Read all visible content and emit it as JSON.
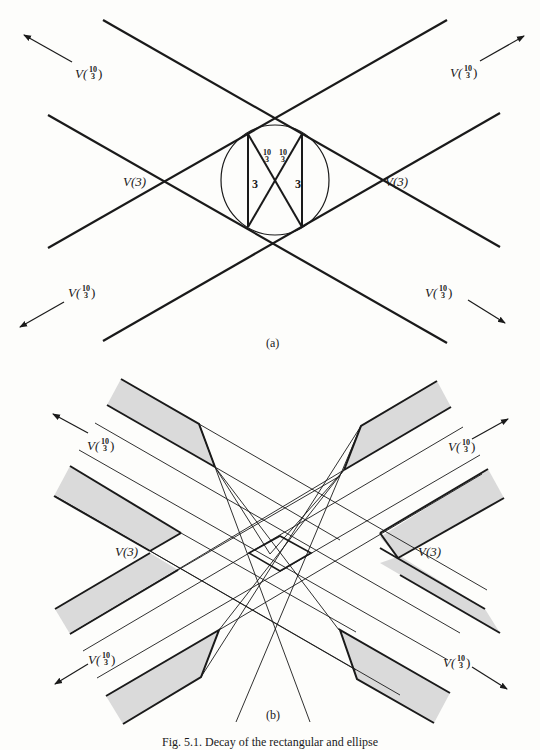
{
  "figure": {
    "caption": "Fig. 5.1. Decay of the rectangular and ellipse",
    "panels": [
      {
        "id": "a",
        "label": "(a)",
        "velocity_labels": {
          "top_left": {
            "prefix": "V(",
            "num": "10",
            "den": "3",
            "suffix": ")"
          },
          "top_right": {
            "prefix": "V(",
            "num": "10",
            "den": "3",
            "suffix": ")"
          },
          "bottom_left": {
            "prefix": "V(",
            "num": "10",
            "den": "3",
            "suffix": ")"
          },
          "bottom_right": {
            "prefix": "V(",
            "num": "10",
            "den": "3",
            "suffix": ")"
          },
          "left": "V(3)",
          "right": "V(3)"
        },
        "inner_labels": {
          "side_left": "3",
          "side_right": "3",
          "diag_left": {
            "num": "10",
            "den": "3"
          },
          "diag_right": {
            "num": "10",
            "den": "3"
          }
        }
      },
      {
        "id": "b",
        "label": "(b)",
        "velocity_labels": {
          "top_left": {
            "prefix": "V(",
            "num": "10",
            "den": "3",
            "suffix": ")"
          },
          "top_right": {
            "prefix": "V(",
            "num": "10",
            "den": "3",
            "suffix": ")"
          },
          "bottom_left": {
            "prefix": "V(",
            "num": "10",
            "den": "3",
            "suffix": ")"
          },
          "bottom_right": {
            "prefix": "V(",
            "num": "10",
            "den": "3",
            "suffix": ")"
          },
          "left": "V(3)",
          "right": "V(3)"
        }
      }
    ]
  },
  "colors": {
    "ink": "#1a1a1a",
    "shade": "#d9d9d9",
    "paper": "#fdfdfb"
  }
}
